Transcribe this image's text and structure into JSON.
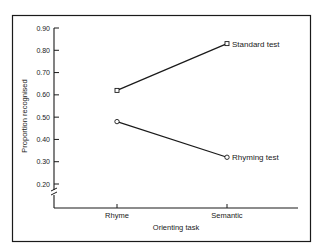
{
  "chart_data": {
    "type": "line",
    "title": "",
    "xlabel": "Orienting task",
    "ylabel": "Proportion recognised",
    "categories": [
      "Rhyme",
      "Semantic"
    ],
    "yticks": [
      "0.20",
      "0.30",
      "0.40",
      "0.50",
      "0.60",
      "0.70",
      "0.80",
      "0.90"
    ],
    "ylim": [
      0.2,
      0.9
    ],
    "axis_break": true,
    "grid": false,
    "legend": "inline-labels-right",
    "series": [
      {
        "name": "Standard test",
        "marker": "square",
        "values": [
          0.62,
          0.83
        ]
      },
      {
        "name": "Rhyming test",
        "marker": "circle",
        "values": [
          0.48,
          0.32
        ]
      }
    ],
    "colors": {
      "ink": "#1a1a1a",
      "background": "#ffffff"
    }
  }
}
